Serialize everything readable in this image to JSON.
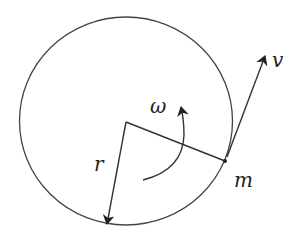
{
  "diagram": {
    "labels": {
      "omega": "ω",
      "radius": "r",
      "velocity": "v",
      "mass": "m"
    },
    "colors": {
      "stroke": "#333333",
      "background": "#ffffff"
    },
    "geometry": {
      "circle_center": [
        126,
        121
      ],
      "circle_radius": 105,
      "mass_point": [
        225,
        161
      ],
      "velocity_tip": [
        265,
        55
      ],
      "radius_arrow_tip": [
        107,
        225
      ]
    }
  }
}
